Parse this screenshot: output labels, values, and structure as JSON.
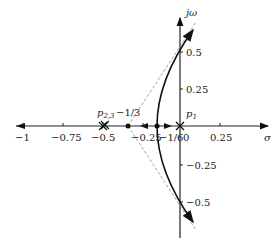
{
  "diagram": {
    "type": "root-locus",
    "axes": {
      "real_label": "σ",
      "imag_label": "jω",
      "real_ticks": [
        {
          "value": -1,
          "label": "−1"
        },
        {
          "value": -0.75,
          "label": "−0.75"
        },
        {
          "value": -0.5,
          "label": "−0.5"
        },
        {
          "value": -0.25,
          "label": "−0.25"
        },
        {
          "value": 0,
          "label": "0"
        },
        {
          "value": 0.25,
          "label": "0.25"
        }
      ],
      "imag_ticks": [
        {
          "value": 0.5,
          "label": "0.5"
        },
        {
          "value": 0.25,
          "label": "0.25"
        },
        {
          "value": -0.25,
          "label": "−0.25"
        },
        {
          "value": -0.5,
          "label": "−0.5"
        }
      ]
    },
    "poles": [
      {
        "name": "p1",
        "label": "p",
        "sub": "1",
        "value": 0
      },
      {
        "name": "p23",
        "label": "p",
        "sub": "2,3",
        "value": -0.5,
        "multiplicity": 2
      }
    ],
    "points": [
      {
        "name": "centroid",
        "label": "−1/3",
        "value": -0.3333
      },
      {
        "name": "breakaway",
        "label": "−1/6",
        "value": -0.1667
      }
    ]
  }
}
